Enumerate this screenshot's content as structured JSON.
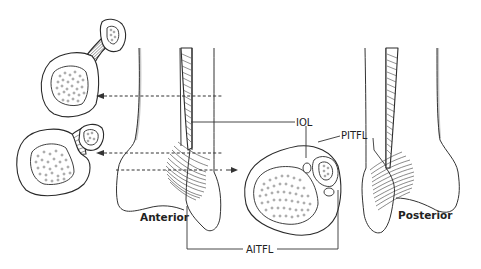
{
  "figure": {
    "views": {
      "anterior_label": "Anterior",
      "posterior_label": "Posterior"
    },
    "labels": {
      "iol": "IOL",
      "pitfl": "PITFL",
      "aitfl": "AITFL"
    },
    "cross_sections": [
      {
        "id": "upper-left",
        "level": "proximal shaft"
      },
      {
        "id": "lower-left",
        "level": "above joint line"
      },
      {
        "id": "center",
        "level": "syndesmosis level"
      }
    ],
    "colors": {
      "line": "#2a2a2a",
      "shadow": "#c9c9c9",
      "background": "#ffffff"
    }
  }
}
